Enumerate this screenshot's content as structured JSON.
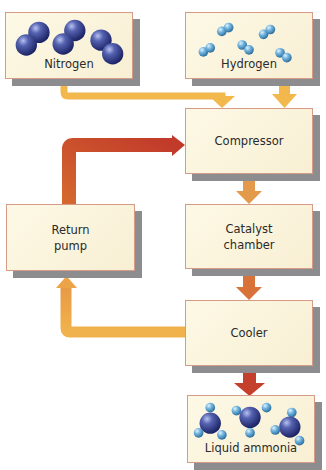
{
  "diagram": {
    "type": "process-flow",
    "nodes": {
      "nitrogen": {
        "label": "Nitrogen",
        "molecule": "N2",
        "molecule_icon": "nitrogen-molecule-icon",
        "count": 3
      },
      "hydrogen": {
        "label": "Hydrogen",
        "molecule": "H2",
        "molecule_icon": "hydrogen-molecule-icon",
        "count": 5
      },
      "compressor": {
        "label": "Compressor"
      },
      "catalyst": {
        "line1": "Catalyst",
        "line2": "chamber"
      },
      "return_pump": {
        "line1": "Return",
        "line2": "pump"
      },
      "cooler": {
        "label": "Cooler"
      },
      "ammonia": {
        "label": "Liquid ammonia",
        "molecule": "NH3",
        "molecule_icon": "ammonia-molecule-icon",
        "count": 3
      }
    },
    "edges": [
      {
        "from": "Nitrogen",
        "to": "Compressor",
        "color": "#f2b84b"
      },
      {
        "from": "Hydrogen",
        "to": "Compressor",
        "color": "#f2b84b"
      },
      {
        "from": "Compressor",
        "to": "Catalyst chamber",
        "color": "#e39a4a"
      },
      {
        "from": "Catalyst chamber",
        "to": "Cooler",
        "color": "#d9713a"
      },
      {
        "from": "Cooler",
        "to": "Liquid ammonia",
        "color": "#c4402c"
      },
      {
        "from": "Cooler",
        "to": "Return pump",
        "color": "#f2b84b"
      },
      {
        "from": "Return pump",
        "to": "Compressor",
        "color": "#c8502e"
      }
    ],
    "colors": {
      "box_fill": "#fbf4dc",
      "box_border": "#d69b86",
      "shadow": "#8d8d8f",
      "nitrogen_atom": "#3a4590",
      "hydrogen_atom": "#6fb4de"
    }
  }
}
